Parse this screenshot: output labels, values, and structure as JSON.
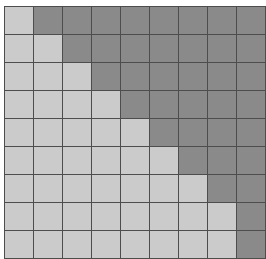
{
  "figure": {
    "name": "triangular-grid-matrix",
    "background_color": "#ffffff",
    "grid_line_color": "#4d4d4d",
    "grid_line_width_px": 1,
    "origin_x_px": 4,
    "origin_y_px": 6,
    "cell_width_px": 28,
    "cell_height_px": 27
  },
  "legend": {
    "light_label": "light cell",
    "dark_label": "dark cell"
  },
  "chart_data": {
    "type": "heatmap",
    "title": "",
    "subtitle": "",
    "xlabel": "",
    "ylabel": "",
    "rows": 9,
    "cols": 9,
    "grid": true,
    "legend_position": "none",
    "categories": [
      "c1",
      "c2",
      "c3",
      "c4",
      "c5",
      "c6",
      "c7",
      "c8",
      "c9"
    ],
    "row_labels": [
      "r1",
      "r2",
      "r3",
      "r4",
      "r5",
      "r6",
      "r7",
      "r8",
      "r9"
    ],
    "xtick_labels": [],
    "ytick_labels": [],
    "value_colors": {
      "0": "#cbcbcb",
      "1": "#8a8a8a"
    },
    "value_names": {
      "0": "light",
      "1": "dark"
    },
    "zlim": [
      0,
      1
    ],
    "dark_count_per_row": [
      8,
      7,
      6,
      5,
      4,
      3,
      2,
      1,
      1
    ],
    "light_count_per_row": [
      1,
      2,
      3,
      4,
      5,
      6,
      7,
      8,
      8
    ],
    "values": [
      [
        0,
        1,
        1,
        1,
        1,
        1,
        1,
        1,
        1
      ],
      [
        0,
        0,
        1,
        1,
        1,
        1,
        1,
        1,
        1
      ],
      [
        0,
        0,
        0,
        1,
        1,
        1,
        1,
        1,
        1
      ],
      [
        0,
        0,
        0,
        0,
        1,
        1,
        1,
        1,
        1
      ],
      [
        0,
        0,
        0,
        0,
        0,
        1,
        1,
        1,
        1
      ],
      [
        0,
        0,
        0,
        0,
        0,
        0,
        1,
        1,
        1
      ],
      [
        0,
        0,
        0,
        0,
        0,
        0,
        0,
        1,
        1
      ],
      [
        0,
        0,
        0,
        0,
        0,
        0,
        0,
        0,
        1
      ],
      [
        0,
        0,
        0,
        0,
        0,
        0,
        0,
        0,
        1
      ]
    ]
  }
}
